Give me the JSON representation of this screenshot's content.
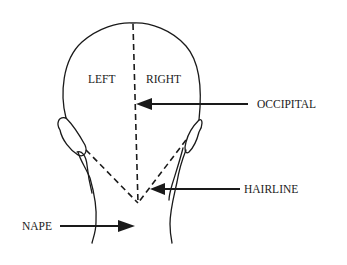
{
  "diagram": {
    "labels": {
      "left": "LEFT",
      "right": "RIGHT",
      "occipital": "OCCIPITAL",
      "hairline": "HAIRLINE",
      "nape": "NAPE"
    },
    "colors": {
      "ink": "#1a1a1a",
      "background": "#ffffff"
    }
  }
}
